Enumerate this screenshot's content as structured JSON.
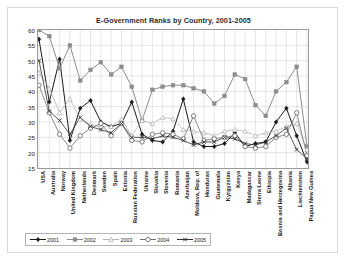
{
  "chart_data": {
    "type": "line",
    "title": "E-Government Ranks by Country, 2001-2005",
    "xlabel": "",
    "ylabel": "",
    "ylim": [
      15,
      60
    ],
    "yticks": [
      60,
      55,
      50,
      45,
      40,
      35,
      30,
      25,
      20,
      15
    ],
    "grid": true,
    "legend_position": "bottom",
    "categories": [
      "USA",
      "Australia",
      "Norway",
      "United Kingdom",
      "Netherlands",
      "Denmark",
      "Sweden",
      "Spain",
      "Estonia",
      "Russian Federation",
      "Ukraine",
      "Slovakia",
      "Slovenia",
      "Romania",
      "Azerbaijan",
      "Moldova, Rep. of",
      "Honduras",
      "Guatemala",
      "Kyrgyzstan",
      "Kenya",
      "Madagascar",
      "Sierra Leone",
      "Ethiopia",
      "Bosnia and Herzegovina",
      "Albania",
      "Liechtenstein",
      "Papua New Guinea"
    ],
    "series": [
      {
        "name": "2001",
        "color": "#1a1a1a",
        "marker": "diamond",
        "values": [
          57,
          36.5,
          50.5,
          24,
          34.5,
          37,
          30,
          28.5,
          29.5,
          36.5,
          26,
          24,
          23.5,
          27,
          37.5,
          23.5,
          22,
          22,
          23,
          26.5,
          22,
          23,
          23.5,
          30,
          34.5,
          25.5,
          17
        ]
      },
      {
        "name": "2002",
        "color": "#8d8d8d",
        "marker": "square",
        "values": [
          60,
          58,
          47.5,
          55,
          43.5,
          47,
          49.5,
          45.5,
          48,
          41.5,
          30.5,
          40.5,
          41.5,
          42,
          42,
          41,
          40,
          36,
          38.5,
          45.5,
          44,
          35.5,
          32,
          40,
          43,
          48,
          22
        ]
      },
      {
        "name": "2003",
        "color": "#b5b5b5",
        "marker": "triangle",
        "values": [
          46,
          41,
          33,
          37.5,
          31,
          29,
          28.5,
          28.5,
          31,
          25.5,
          30.5,
          29.5,
          31.5,
          31,
          27.5,
          27,
          26.5,
          25.5,
          27,
          27.5,
          27,
          25.5,
          26.5,
          27,
          28.5,
          29.5,
          21
        ]
      },
      {
        "name": "2004",
        "color": "#6f6f6f",
        "marker": "circle",
        "values": [
          42,
          33,
          26,
          21.5,
          25.5,
          28,
          29.5,
          25.5,
          29.5,
          24,
          23.5,
          26,
          26.5,
          26,
          24.5,
          32,
          24,
          24.5,
          25,
          25.5,
          22,
          21.5,
          22,
          25,
          26,
          33,
          19
        ]
      },
      {
        "name": "2005",
        "color": "#2e2e2e",
        "marker": "cross",
        "values": [
          50,
          33.5,
          30.5,
          26,
          31.5,
          28.5,
          27.5,
          26.5,
          29.5,
          25,
          25,
          24.5,
          25.5,
          25,
          24,
          22.5,
          23.5,
          23.5,
          25,
          24.5,
          23,
          22.5,
          23.5,
          25.5,
          28,
          21,
          18
        ]
      }
    ]
  }
}
